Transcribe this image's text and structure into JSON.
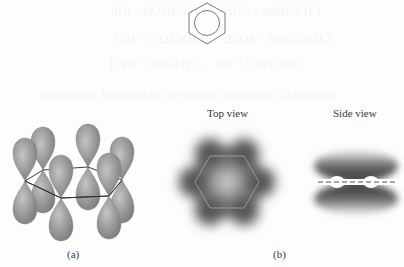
{
  "figure": {
    "benzene_symbol": {
      "shape": "hexagon-with-inscribed-circle",
      "center": [
        207,
        22
      ],
      "stroke": "#6a6a6a"
    },
    "panel_a": {
      "caption": "(a)",
      "orbital_color": "#8c8c8c",
      "orbital_highlight": "#bdbdbd",
      "ring_outline_color": "#2a2a2a",
      "orbitals": [
        {
          "name": "p-orbital-far-left",
          "x": 25,
          "y": 181
        },
        {
          "name": "p-orbital-back-left",
          "x": 43,
          "y": 170
        },
        {
          "name": "p-orbital-back-middle",
          "x": 88,
          "y": 167
        },
        {
          "name": "p-orbital-back-right",
          "x": 122,
          "y": 180
        },
        {
          "name": "p-orbital-front-left",
          "x": 61,
          "y": 198
        },
        {
          "name": "p-orbital-front-right",
          "x": 109,
          "y": 196
        }
      ]
    },
    "panel_b": {
      "caption": "(b)",
      "top_view": {
        "label": "Top view",
        "center": [
          227,
          182
        ],
        "cloud_color": "#2e2e2e",
        "ring_line_color": "#a0a0a0"
      },
      "side_view": {
        "label": "Side view",
        "center": [
          356,
          182
        ],
        "cloud_color": "#333333",
        "dash_color": "#8a8a8a"
      }
    }
  },
  "bleed_through_text": [
    "CH3CH2Br + KOH  →  CH3CH2OH + KBr",
    "CH3CH2OH + SOCl2  →  CH3CH2Cl + HCl",
    "CH3CH2Cl + NaI  →  CH3CH2I + NaCl",
    "electrophilic addition to benzene is not observed; substitution"
  ]
}
